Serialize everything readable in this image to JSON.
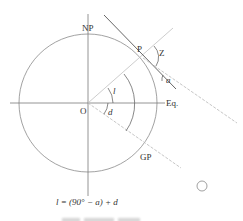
{
  "diagram": {
    "labels": {
      "north_pole": "NP",
      "point": "P",
      "zenith_angle": "Z",
      "altitude": "a",
      "origin": "O",
      "equator": "Eq.",
      "latitude": "l",
      "declination": "d",
      "geographic_position": "GP"
    },
    "formula": "l = (90° − a) + d",
    "caption": "",
    "colors": {
      "circle": "#8a8a8a",
      "axes": "#7a7a7a",
      "tangent": "#555555",
      "dashed_ray": "#b8b8b8",
      "text": "#333333"
    }
  }
}
